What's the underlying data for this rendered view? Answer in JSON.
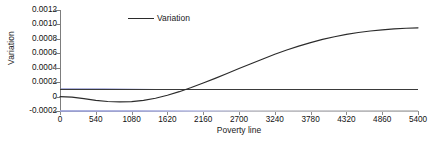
{
  "chart_data": {
    "type": "line",
    "title": "",
    "xlabel": "Poverty line",
    "ylabel": "Variation",
    "xlim": [
      0,
      5400
    ],
    "ylim": [
      -0.0002,
      0.0012
    ],
    "grid": false,
    "legend_position": "top-center-left",
    "x_ticks": [
      "0",
      "540",
      "1080",
      "1620",
      "2160",
      "2700",
      "3240",
      "3780",
      "4320",
      "4860",
      "5400"
    ],
    "x_tick_values": [
      0,
      540,
      1080,
      1620,
      2160,
      2700,
      3240,
      3780,
      4320,
      4860,
      5400
    ],
    "y_ticks": [
      "0.0012",
      "0.0010",
      "0.0008",
      "0.0006",
      "0.0004",
      "0.0002",
      "0",
      "-0.0002"
    ],
    "y_tick_values": [
      0.0012,
      0.001,
      0.0008,
      0.0006,
      0.0004,
      0.0002,
      0,
      -0.0002
    ],
    "series": [
      {
        "name": "Variation",
        "color": "#2b2b2b",
        "x": [
          0,
          180,
          360,
          540,
          720,
          900,
          1080,
          1260,
          1440,
          1620,
          1800,
          1980,
          2160,
          2340,
          2520,
          2700,
          2880,
          3060,
          3240,
          3420,
          3600,
          3780,
          3960,
          4140,
          4320,
          4500,
          4680,
          4860,
          5040,
          5220,
          5400
        ],
        "values": [
          0.0,
          -8e-06,
          -2.9e-05,
          -5.2e-05,
          -6.9e-05,
          -7.4e-05,
          -7e-05,
          -5.3e-05,
          -2.3e-05,
          1.8e-05,
          6.8e-05,
          0.000125,
          0.000187,
          0.000252,
          0.00032,
          0.000388,
          0.000456,
          0.000522,
          0.000586,
          0.000645,
          0.000699,
          0.000748,
          0.000792,
          0.00083,
          0.000862,
          0.000888,
          0.000909,
          0.000925,
          0.000938,
          0.000947,
          0.000953
        ]
      },
      {
        "name": "baseline-trace",
        "color": "#9aa0d8",
        "x": [
          0,
          5400
        ],
        "values": [
          -0.0002,
          -0.0002
        ]
      }
    ],
    "annotations": []
  },
  "legend": {
    "entries": [
      {
        "label": "Variation"
      }
    ]
  },
  "axes": {
    "x_title": "Poverty line",
    "y_title": "Variation"
  },
  "caption_fragment": ""
}
